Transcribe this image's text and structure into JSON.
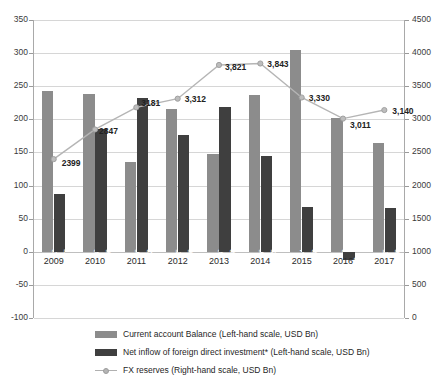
{
  "chart_data": {
    "type": "bar",
    "title": "",
    "subtitle": "",
    "xlabel": "",
    "ylabel": "",
    "categories": [
      "2009",
      "2010",
      "2011",
      "2012",
      "2013",
      "2014",
      "2015",
      "2016",
      "2017"
    ],
    "grid": true,
    "legend_position": "bottom",
    "axes": {
      "left": {
        "label": "Left-hand scale, USD Bn",
        "min": -100,
        "max": 350,
        "step": 50,
        "ticks": [
          "350",
          "300",
          "250",
          "200",
          "150",
          "100",
          "50",
          "0",
          "-50",
          "-100"
        ],
        "tick_values": [
          350,
          300,
          250,
          200,
          150,
          100,
          50,
          0,
          -50,
          -100
        ]
      },
      "right": {
        "label": "Right-hand scale, USD Bn",
        "min": 0,
        "max": 4500,
        "step": 500,
        "ticks": [
          "4500",
          "4000",
          "3500",
          "3000",
          "2500",
          "2000",
          "1500",
          "1000",
          "500",
          "0"
        ],
        "tick_values": [
          4500,
          4000,
          3500,
          3000,
          2500,
          2000,
          1500,
          1000,
          500,
          0
        ]
      }
    },
    "series": [
      {
        "name": "Current account Balance (Left-hand scale, USD Bn)",
        "short_name": "Current account Balance",
        "type": "bar",
        "axis": "left",
        "color": "#8c8c8c",
        "values": [
          243,
          238,
          136,
          215,
          148,
          236,
          304,
          202,
          165
        ],
        "labels": [
          "243",
          "238",
          "136",
          "215",
          "148",
          "236",
          "304",
          "202",
          "165"
        ]
      },
      {
        "name": "Net inflow of foreign direct investment* (Left-hand scale, USD Bn)",
        "short_name": "Net inflow of foreign direct investment*",
        "type": "bar",
        "axis": "left",
        "color": "#3f3f3f",
        "values": [
          87,
          186,
          232,
          176,
          218,
          145,
          68,
          -12,
          66
        ],
        "labels": [
          "87",
          "186",
          "232",
          "176",
          "218",
          "145",
          "68",
          "-12",
          "66"
        ]
      },
      {
        "name": "FX reserves (Right-hand scale, USD Bn)",
        "short_name": "FX reserves",
        "type": "line",
        "axis": "right",
        "color": "#b5b5b5",
        "marker": "circle",
        "values": [
          2399,
          2847,
          3181,
          3312,
          3821,
          3843,
          3330,
          3011,
          3140
        ],
        "labels": [
          "2399",
          "2847",
          "3181",
          "3,312",
          "3,821",
          "3,843",
          "3,330",
          "3,011",
          "3,140"
        ]
      }
    ]
  },
  "legend": {
    "items": [
      {
        "label": "Current account Balance (Left-hand scale, USD Bn)",
        "marker": "swatch-cab"
      },
      {
        "label": "Net inflow of foreign direct investment* (Left-hand scale, USD Bn)",
        "marker": "swatch-fdi"
      },
      {
        "label": "FX reserves (Right-hand scale, USD Bn)",
        "marker": "line-marker"
      }
    ]
  }
}
